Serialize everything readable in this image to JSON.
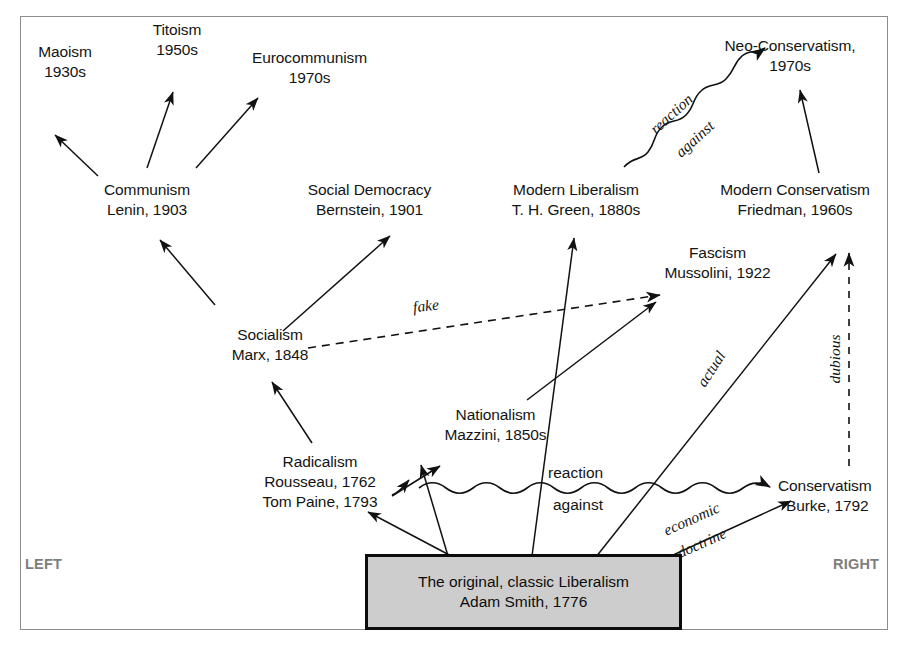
{
  "diagram": {
    "frame": {
      "border_color": "#8d8d8d",
      "background": "#ffffff"
    },
    "spectrum": {
      "left_label": "LEFT",
      "right_label": "RIGHT",
      "label_color": "#7e7e7e"
    },
    "root_box": {
      "line1": "The original, classic Liberalism",
      "line2": "Adam Smith, 1776",
      "fill_color": "#cdcdcd",
      "border_color": "#0c0c0c"
    },
    "nodes": [
      {
        "id": "maoism",
        "line1": "Maoism",
        "line2": "1930s"
      },
      {
        "id": "titoism",
        "line1": "Titoism",
        "line2": "1950s"
      },
      {
        "id": "eurocommunism",
        "line1": "Eurocommunism",
        "line2": "1970s"
      },
      {
        "id": "communism",
        "line1": "Communism",
        "line2": "Lenin, 1903"
      },
      {
        "id": "social-democracy",
        "line1": "Social Democracy",
        "line2": "Bernstein, 1901"
      },
      {
        "id": "modern-liberalism",
        "line1": "Modern Liberalism",
        "line2": "T. H. Green, 1880s"
      },
      {
        "id": "neo-conservatism",
        "line1": "Neo-Conservatism,",
        "line2": "1970s"
      },
      {
        "id": "modern-conservatism",
        "line1": "Modern Conservatism",
        "line2": "Friedman, 1960s"
      },
      {
        "id": "fascism",
        "line1": "Fascism",
        "line2": "Mussolini, 1922"
      },
      {
        "id": "socialism",
        "line1": "Socialism",
        "line2": "Marx, 1848"
      },
      {
        "id": "nationalism",
        "line1": "Nationalism",
        "line2": "Mazzini, 1850s"
      },
      {
        "id": "radicalism",
        "line1": "Radicalism",
        "line2": "Rousseau, 1762",
        "line3": "Tom Paine, 1793"
      },
      {
        "id": "conservatism",
        "line1": "Conservatism",
        "line2": "Burke, 1792"
      }
    ],
    "edge_labels": {
      "fake": "fake",
      "actual": "actual",
      "dubious": "dubious",
      "economic": "economic",
      "doctrine": "doctrine",
      "reaction_top": "reaction",
      "against_top": "against",
      "reaction_mid": "reaction",
      "against_mid": "against"
    }
  }
}
